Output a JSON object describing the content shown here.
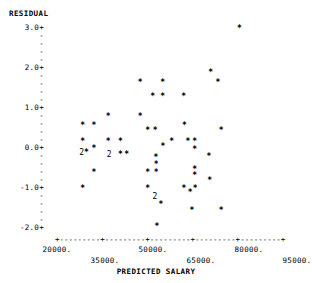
{
  "plot": {
    "y_axis_title": "RESIDUAL",
    "x_axis_title": "PREDICTED SALARY",
    "y_major_labels": [
      "3.0+",
      "2.0+",
      "1.0+",
      "0.0+",
      "-1.0+",
      "-2.0+"
    ],
    "y_minor_tick": "-",
    "x_tick_labels": [
      "20000.",
      "35000.",
      "50000.",
      "65000.",
      "80000.",
      "95000."
    ],
    "x_axis_line": "+---------+---------+---------+---------+---------+",
    "point_marker": "*",
    "overlap_marker_2": "2",
    "colors": {
      "background": "#ffffff",
      "ink": "#000000"
    }
  },
  "chart_data": {
    "type": "scatter",
    "title": "",
    "xlabel": "PREDICTED SALARY",
    "ylabel": "RESIDUAL",
    "xlim": [
      20000,
      95000
    ],
    "ylim": [
      -2.2,
      3.2
    ],
    "xticks": [
      20000,
      35000,
      50000,
      65000,
      80000,
      95000
    ],
    "yticks": [
      3.0,
      2.0,
      1.0,
      0.0,
      -1.0,
      -2.0
    ],
    "grid": false,
    "legend": null,
    "marker": "*",
    "note": "Counts greater than 1 are rendered as the digit '2' where two observations share a character cell.",
    "points": [
      {
        "x": 28000,
        "y": 0.55,
        "count": 1
      },
      {
        "x": 28000,
        "y": 0.15,
        "count": 1
      },
      {
        "x": 27700,
        "y": -0.12,
        "count": 2
      },
      {
        "x": 29200,
        "y": -0.12,
        "count": 1
      },
      {
        "x": 28000,
        "y": -1.02,
        "count": 1
      },
      {
        "x": 31500,
        "y": 0.55,
        "count": 1
      },
      {
        "x": 31500,
        "y": -0.03,
        "count": 1
      },
      {
        "x": 31500,
        "y": -0.62,
        "count": 1
      },
      {
        "x": 36000,
        "y": 0.78,
        "count": 1
      },
      {
        "x": 36000,
        "y": 0.15,
        "count": 1
      },
      {
        "x": 36300,
        "y": -0.17,
        "count": 2
      },
      {
        "x": 39800,
        "y": -0.17,
        "count": 1
      },
      {
        "x": 39800,
        "y": 0.15,
        "count": 1
      },
      {
        "x": 41800,
        "y": -0.17,
        "count": 1
      },
      {
        "x": 46000,
        "y": 1.62,
        "count": 1
      },
      {
        "x": 46000,
        "y": 0.78,
        "count": 1
      },
      {
        "x": 48300,
        "y": 0.42,
        "count": 1
      },
      {
        "x": 50700,
        "y": 0.42,
        "count": 1
      },
      {
        "x": 48300,
        "y": -0.63,
        "count": 1
      },
      {
        "x": 48300,
        "y": -1.02,
        "count": 1
      },
      {
        "x": 49900,
        "y": 1.28,
        "count": 1
      },
      {
        "x": 51000,
        "y": -0.42,
        "count": 1
      },
      {
        "x": 51000,
        "y": -0.63,
        "count": 1
      },
      {
        "x": 50900,
        "y": -0.25,
        "count": 1
      },
      {
        "x": 50600,
        "y": -1.22,
        "count": 2
      },
      {
        "x": 52500,
        "y": -1.42,
        "count": 1
      },
      {
        "x": 51200,
        "y": -1.98,
        "count": 1
      },
      {
        "x": 53000,
        "y": 1.62,
        "count": 1
      },
      {
        "x": 53000,
        "y": 1.28,
        "count": 1
      },
      {
        "x": 53100,
        "y": 0.02,
        "count": 1
      },
      {
        "x": 55800,
        "y": 0.15,
        "count": 1
      },
      {
        "x": 59600,
        "y": 1.28,
        "count": 1
      },
      {
        "x": 59800,
        "y": 0.55,
        "count": 1
      },
      {
        "x": 60900,
        "y": 0.15,
        "count": 1
      },
      {
        "x": 63000,
        "y": 0.15,
        "count": 1
      },
      {
        "x": 63000,
        "y": -0.05,
        "count": 1
      },
      {
        "x": 59700,
        "y": -1.02,
        "count": 1
      },
      {
        "x": 61600,
        "y": -1.12,
        "count": 1
      },
      {
        "x": 63000,
        "y": -0.55,
        "count": 1
      },
      {
        "x": 63000,
        "y": -0.7,
        "count": 1
      },
      {
        "x": 63200,
        "y": -1.02,
        "count": 1
      },
      {
        "x": 62200,
        "y": -1.58,
        "count": 1
      },
      {
        "x": 68000,
        "y": 1.88,
        "count": 1
      },
      {
        "x": 70300,
        "y": 1.62,
        "count": 1
      },
      {
        "x": 67500,
        "y": -0.22,
        "count": 1
      },
      {
        "x": 67700,
        "y": -0.82,
        "count": 1
      },
      {
        "x": 71300,
        "y": 0.42,
        "count": 1
      },
      {
        "x": 71300,
        "y": -1.58,
        "count": 1
      },
      {
        "x": 77000,
        "y": 2.98,
        "count": 1
      }
    ]
  }
}
